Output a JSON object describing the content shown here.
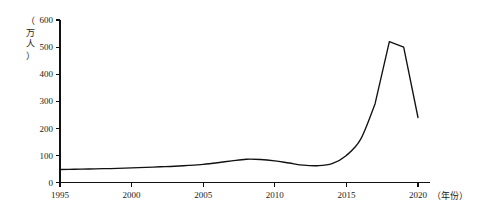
{
  "chart_data": {
    "type": "line",
    "title": "",
    "xlabel": "（年份）",
    "ylabel": "（万人）",
    "x": [
      1995,
      1996,
      1997,
      1998,
      1999,
      2000,
      2001,
      2002,
      2003,
      2004,
      2005,
      2006,
      2007,
      2008,
      2009,
      2010,
      2011,
      2012,
      2013,
      2014,
      2015,
      2016,
      2017,
      2018,
      2019,
      2020
    ],
    "values": [
      48,
      49,
      50,
      51,
      52,
      54,
      56,
      58,
      60,
      63,
      67,
      73,
      80,
      86,
      85,
      80,
      72,
      64,
      62,
      70,
      100,
      160,
      290,
      520,
      500,
      240
    ],
    "series": [
      {
        "name": "人数",
        "values": [
          48,
          49,
          50,
          51,
          52,
          54,
          56,
          58,
          60,
          63,
          67,
          73,
          80,
          86,
          85,
          80,
          72,
          64,
          62,
          70,
          100,
          160,
          290,
          520,
          500,
          240
        ]
      }
    ],
    "xlim": [
      1995,
      2020
    ],
    "ylim": [
      0,
      600
    ],
    "xticks": [
      1995,
      2000,
      2005,
      2010,
      2015,
      2020
    ],
    "xtick_labels": [
      "1995",
      "2000",
      "2005",
      "2010",
      "2015",
      "2020"
    ],
    "yticks": [
      0,
      100,
      200,
      300,
      400,
      500,
      600
    ],
    "ytick_labels": [
      "0",
      "100",
      "200",
      "300",
      "400",
      "500",
      "600"
    ],
    "grid": false,
    "legend": false,
    "legend_position": "none",
    "line_color": "#111111"
  },
  "axis": {
    "y_label_chars": [
      "（",
      "万",
      "人",
      "）"
    ],
    "x_label_text": "（年份）"
  }
}
